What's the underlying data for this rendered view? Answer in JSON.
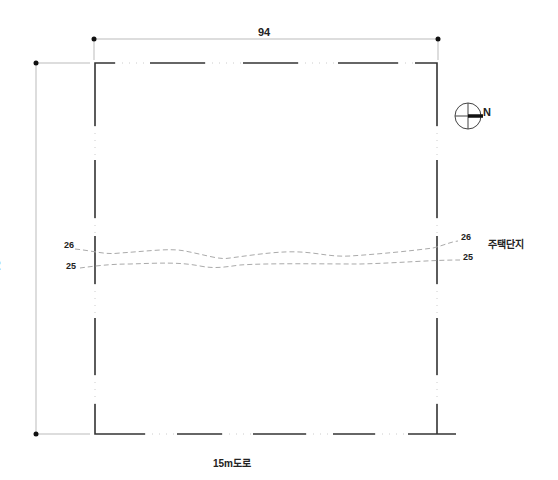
{
  "drawing": {
    "type": "site-plan",
    "dimensions": {
      "width_label": "94",
      "depth_label": "91"
    },
    "labels": {
      "road": "15m도로",
      "adjacent": "주택단지",
      "north": "N"
    },
    "contours": [
      {
        "id": "contour-26",
        "left_label": "26",
        "right_label": "26"
      },
      {
        "id": "contour-25",
        "left_label": "25",
        "right_label": "25"
      }
    ],
    "colors": {
      "boundary": "#333333",
      "dimension": "#bbbbbb",
      "contour": "#aaaaaa",
      "text": "#222222"
    }
  }
}
